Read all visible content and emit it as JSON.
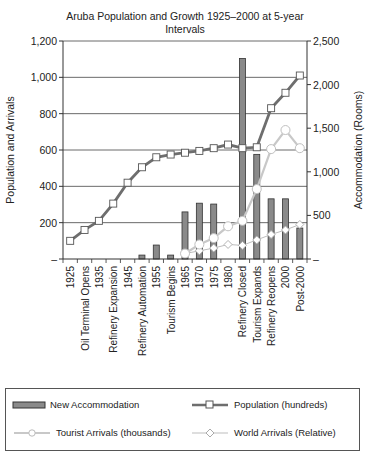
{
  "chart_data": {
    "type": "bar+line",
    "title": "Aruba Population and Growth 1925–2000 at 5-year Intervals",
    "title_lines": [
      "Aruba Population and Growth 1925–2000 at 5-year",
      "Intervals"
    ],
    "xlabel": "",
    "ylabel": "Population and Arrivals",
    "y2label": "Accommodation (Rooms)",
    "ylim": [
      0,
      1200
    ],
    "y2lim": [
      0,
      2500
    ],
    "yticks": [
      "–",
      "200",
      "400",
      "600",
      "800",
      "1,000",
      "1,200"
    ],
    "y2ticks": [
      "–",
      "500",
      "1,000",
      "1,500",
      "2,000",
      "2,500"
    ],
    "grid": true,
    "legend_position": "bottom",
    "categories": [
      "1925",
      "Oil Terminal Opens",
      "1935",
      "Refinery Expansion",
      "1945",
      "Refinery Automation",
      "1955",
      "Tourism Begins",
      "1965",
      "1970",
      "1975",
      "1980",
      "Refinery Closed",
      "Tourism Expands",
      "Refinery Reopens",
      "2000",
      "Post-2000"
    ],
    "series": [
      {
        "name": "New Accommodation",
        "type": "bar",
        "axis": "right",
        "values": [
          null,
          null,
          null,
          null,
          null,
          45,
          160,
          45,
          540,
          640,
          630,
          null,
          2300,
          1200,
          690,
          690,
          355
        ]
      },
      {
        "name": "Population (hundreds)",
        "type": "line",
        "axis": "left",
        "marker": "square",
        "values": [
          100,
          160,
          210,
          305,
          420,
          505,
          560,
          575,
          585,
          595,
          610,
          630,
          610,
          615,
          830,
          915,
          1010
        ]
      },
      {
        "name": "Tourist Arrivals (thousands)",
        "type": "line",
        "axis": "left",
        "marker": "circle",
        "values": [
          null,
          null,
          null,
          null,
          null,
          null,
          null,
          null,
          30,
          80,
          115,
          180,
          210,
          385,
          605,
          710,
          610
        ]
      },
      {
        "name": "World Arrivals (Relative)",
        "type": "line",
        "axis": "left",
        "marker": "diamond",
        "values": [
          null,
          null,
          null,
          null,
          null,
          null,
          null,
          null,
          30,
          45,
          60,
          80,
          75,
          105,
          135,
          160,
          190
        ]
      }
    ],
    "colors": {
      "bar_fill": "#8a8a8a",
      "bar_stroke": "#333333",
      "population": "#6e6e6e",
      "tourist": "#c8c8c8",
      "world": "#bdbdbd",
      "grid": "#444444"
    }
  },
  "legend": {
    "items": [
      {
        "label": "New Accommodation"
      },
      {
        "label": "Population (hundreds)"
      },
      {
        "label": "Tourist Arrivals (thousands)"
      },
      {
        "label": "World Arrivals (Relative)"
      }
    ]
  }
}
